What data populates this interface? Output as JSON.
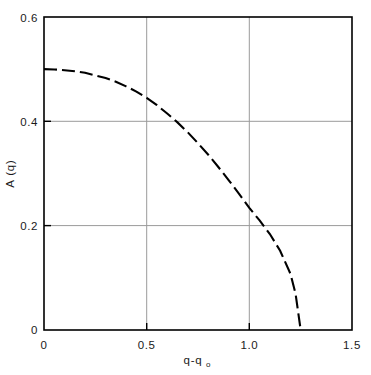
{
  "chart_data": {
    "type": "line",
    "title": "",
    "subtitle": "",
    "xlabel": "q-q",
    "xlabel_sub": "o",
    "ylabel": "A (q)",
    "xlim": [
      0,
      1.5
    ],
    "ylim": [
      0,
      0.6
    ],
    "grid": true,
    "legend": null,
    "line_style": "dashed",
    "line_color": "#000000",
    "grid_color": "#9a9a9a",
    "axis_color": "#000000",
    "background": "#ffffff",
    "xticks": [
      0,
      0.5,
      1.0,
      1.5
    ],
    "xtick_labels": [
      "0",
      "0.5",
      "1.0",
      "1.5"
    ],
    "yticks": [
      0,
      0.2,
      0.4,
      0.6
    ],
    "ytick_labels": [
      "0",
      "0.2",
      "0.4",
      "0.6"
    ],
    "series": [
      {
        "name": "A(q)",
        "x": [
          0.0,
          0.05,
          0.1,
          0.15,
          0.2,
          0.25,
          0.3,
          0.35,
          0.4,
          0.45,
          0.5,
          0.55,
          0.6,
          0.65,
          0.7,
          0.75,
          0.8,
          0.85,
          0.9,
          0.95,
          1.0,
          1.05,
          1.1,
          1.15,
          1.2,
          1.225,
          1.25
        ],
        "y": [
          0.5,
          0.4995,
          0.498,
          0.496,
          0.493,
          0.488,
          0.483,
          0.476,
          0.467,
          0.457,
          0.445,
          0.431,
          0.415,
          0.398,
          0.379,
          0.358,
          0.336,
          0.312,
          0.287,
          0.261,
          0.234,
          0.21,
          0.184,
          0.152,
          0.108,
          0.07,
          0.0
        ]
      }
    ]
  },
  "axes": {
    "ylabel_text": "A (q)",
    "xlabel_main": "q-q",
    "xlabel_subscript": "o"
  },
  "labels": {
    "y_0_6": "0.6",
    "y_0_4": "0.4",
    "y_0_2": "0.2",
    "y_0": "0",
    "x_0": "0",
    "x_0_5": "0.5",
    "x_1_0": "1.0",
    "x_1_5": "1.5"
  }
}
